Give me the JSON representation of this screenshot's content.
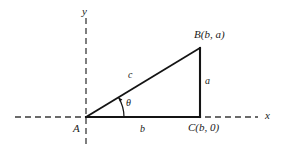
{
  "figure": {
    "type": "geometry-diagram",
    "background_color": "#ffffff",
    "stroke_color": "#1a1a1a",
    "axis_style": "dashed"
  },
  "axes": {
    "x_label": "x",
    "y_label": "y"
  },
  "vertices": {
    "a": "A",
    "b": "B(b, a)",
    "c": "C(b, 0)"
  },
  "sides": {
    "hypotenuse": "c",
    "vertical": "a",
    "base": "b"
  },
  "angle": {
    "label": "θ"
  },
  "geometry": {
    "origin_x": 86,
    "origin_y": 117,
    "corner_x": 200,
    "corner_y": 117,
    "apex_x": 200,
    "apex_y": 48,
    "x_axis_start": 15,
    "x_axis_end": 258,
    "y_axis_top": 18,
    "y_axis_bottom": 148
  }
}
